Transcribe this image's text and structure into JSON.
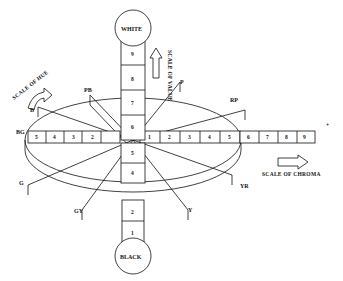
{
  "diagram": {
    "value_axis": {
      "top_label": "WHITE",
      "bottom_label": "BLACK",
      "steps_upper": [
        "9",
        "8",
        "7",
        "6"
      ],
      "steps_lower": [
        "5",
        "4"
      ],
      "steps_bottom": [
        "2",
        "1"
      ],
      "caption": "SCALE OF VALUE"
    },
    "hue_ring": {
      "caption": "SCALE OF HUE",
      "hues": [
        "PB",
        "B",
        "BG",
        "G",
        "GY",
        "Y",
        "YR",
        "RP",
        "P"
      ]
    },
    "chroma_axis": {
      "caption": "SCALE OF CHROMA",
      "left_steps": [
        "5",
        "4",
        "3",
        "2"
      ],
      "right_inner_steps": [
        "1",
        "2",
        "3",
        "4",
        "5"
      ],
      "right_outer_steps": [
        "6",
        "7",
        "8",
        "9"
      ],
      "end_marker": "+"
    }
  }
}
